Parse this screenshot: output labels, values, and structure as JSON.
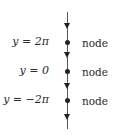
{
  "diagram": {
    "type": "phase-line",
    "axis": {
      "orientation": "vertical",
      "flow_direction": "down"
    },
    "equilibria": [
      {
        "label": "y = 2π",
        "classification": "node"
      },
      {
        "label": "y = 0",
        "classification": "node"
      },
      {
        "label": "y = −2π",
        "classification": "node"
      }
    ],
    "arrows": [
      "down",
      "down",
      "down",
      "down"
    ],
    "colors": {
      "line": "#555555",
      "marker": "#222222",
      "text": "#2a2a2a"
    }
  }
}
